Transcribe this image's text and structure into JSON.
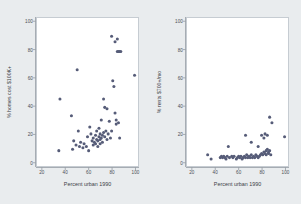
{
  "figure": {
    "background_color": "#e9ecee",
    "panel_background_color": "#ffffff",
    "marker_color": "#565c78",
    "frame_color": "#c6ccd2"
  },
  "chart_data": [
    {
      "type": "scatter",
      "title": "",
      "xlabel": "Percent urban 1990",
      "ylabel": "% homes cost $100K+",
      "xlim": [
        15,
        103
      ],
      "ylim": [
        -3,
        103
      ],
      "xticks": [
        20,
        40,
        60,
        80,
        100
      ],
      "yticks": [
        0,
        20,
        40,
        60,
        80,
        100
      ],
      "grid": false,
      "legend": "none",
      "points": [
        {
          "x": 35,
          "y": 45
        },
        {
          "x": 34,
          "y": 8
        },
        {
          "x": 45,
          "y": 33
        },
        {
          "x": 46,
          "y": 9
        },
        {
          "x": 47,
          "y": 15
        },
        {
          "x": 49,
          "y": 12
        },
        {
          "x": 50,
          "y": 66
        },
        {
          "x": 51,
          "y": 22
        },
        {
          "x": 52,
          "y": 11
        },
        {
          "x": 53,
          "y": 14
        },
        {
          "x": 55,
          "y": 10
        },
        {
          "x": 56,
          "y": 13
        },
        {
          "x": 58,
          "y": 11
        },
        {
          "x": 59,
          "y": 18
        },
        {
          "x": 60,
          "y": 8
        },
        {
          "x": 61,
          "y": 25
        },
        {
          "x": 62,
          "y": 20
        },
        {
          "x": 63,
          "y": 15
        },
        {
          "x": 64,
          "y": 12
        },
        {
          "x": 64,
          "y": 17
        },
        {
          "x": 65,
          "y": 14
        },
        {
          "x": 66,
          "y": 19
        },
        {
          "x": 66,
          "y": 13
        },
        {
          "x": 67,
          "y": 16
        },
        {
          "x": 67,
          "y": 22
        },
        {
          "x": 68,
          "y": 15
        },
        {
          "x": 68,
          "y": 11
        },
        {
          "x": 69,
          "y": 18
        },
        {
          "x": 69,
          "y": 24
        },
        {
          "x": 70,
          "y": 16
        },
        {
          "x": 70,
          "y": 13
        },
        {
          "x": 70,
          "y": 20
        },
        {
          "x": 71,
          "y": 17
        },
        {
          "x": 71,
          "y": 30
        },
        {
          "x": 72,
          "y": 19
        },
        {
          "x": 72,
          "y": 14
        },
        {
          "x": 73,
          "y": 21
        },
        {
          "x": 73,
          "y": 45
        },
        {
          "x": 74,
          "y": 39
        },
        {
          "x": 74,
          "y": 18
        },
        {
          "x": 75,
          "y": 22
        },
        {
          "x": 76,
          "y": 38
        },
        {
          "x": 76,
          "y": 16
        },
        {
          "x": 77,
          "y": 20
        },
        {
          "x": 78,
          "y": 29
        },
        {
          "x": 79,
          "y": 17
        },
        {
          "x": 80,
          "y": 90
        },
        {
          "x": 80,
          "y": 22
        },
        {
          "x": 81,
          "y": 58
        },
        {
          "x": 82,
          "y": 54
        },
        {
          "x": 83,
          "y": 86
        },
        {
          "x": 83,
          "y": 35
        },
        {
          "x": 84,
          "y": 27
        },
        {
          "x": 84,
          "y": 30
        },
        {
          "x": 85,
          "y": 88
        },
        {
          "x": 85,
          "y": 79
        },
        {
          "x": 86,
          "y": 79
        },
        {
          "x": 86,
          "y": 28
        },
        {
          "x": 87,
          "y": 79
        },
        {
          "x": 87,
          "y": 17
        },
        {
          "x": 88,
          "y": 79
        },
        {
          "x": 100,
          "y": 62
        }
      ]
    },
    {
      "type": "scatter",
      "title": "",
      "xlabel": "Percent urban 1990",
      "ylabel": "% rents $700+/mo",
      "xlim": [
        15,
        103
      ],
      "ylim": [
        -3,
        103
      ],
      "xticks": [
        20,
        40,
        60,
        80,
        100
      ],
      "yticks": [
        0,
        20,
        40,
        60,
        80,
        100
      ],
      "grid": false,
      "legend": "none",
      "points": [
        {
          "x": 33,
          "y": 5
        },
        {
          "x": 36,
          "y": 2
        },
        {
          "x": 44,
          "y": 3
        },
        {
          "x": 45,
          "y": 4
        },
        {
          "x": 46,
          "y": 3
        },
        {
          "x": 47,
          "y": 4
        },
        {
          "x": 48,
          "y": 3
        },
        {
          "x": 49,
          "y": 2
        },
        {
          "x": 50,
          "y": 4
        },
        {
          "x": 51,
          "y": 11
        },
        {
          "x": 52,
          "y": 3
        },
        {
          "x": 54,
          "y": 4
        },
        {
          "x": 55,
          "y": 3
        },
        {
          "x": 56,
          "y": 4
        },
        {
          "x": 58,
          "y": 2
        },
        {
          "x": 59,
          "y": 3
        },
        {
          "x": 60,
          "y": 4
        },
        {
          "x": 61,
          "y": 3
        },
        {
          "x": 62,
          "y": 4
        },
        {
          "x": 63,
          "y": 2
        },
        {
          "x": 64,
          "y": 3
        },
        {
          "x": 65,
          "y": 4
        },
        {
          "x": 66,
          "y": 19
        },
        {
          "x": 66,
          "y": 3
        },
        {
          "x": 67,
          "y": 5
        },
        {
          "x": 68,
          "y": 3
        },
        {
          "x": 69,
          "y": 4
        },
        {
          "x": 70,
          "y": 3
        },
        {
          "x": 71,
          "y": 14
        },
        {
          "x": 71,
          "y": 5
        },
        {
          "x": 72,
          "y": 3
        },
        {
          "x": 73,
          "y": 4
        },
        {
          "x": 74,
          "y": 3
        },
        {
          "x": 75,
          "y": 5
        },
        {
          "x": 76,
          "y": 4
        },
        {
          "x": 77,
          "y": 11
        },
        {
          "x": 77,
          "y": 3
        },
        {
          "x": 78,
          "y": 4
        },
        {
          "x": 79,
          "y": 5
        },
        {
          "x": 80,
          "y": 19
        },
        {
          "x": 80,
          "y": 6
        },
        {
          "x": 81,
          "y": 5
        },
        {
          "x": 82,
          "y": 17
        },
        {
          "x": 82,
          "y": 7
        },
        {
          "x": 83,
          "y": 20
        },
        {
          "x": 83,
          "y": 6
        },
        {
          "x": 84,
          "y": 8
        },
        {
          "x": 84,
          "y": 5
        },
        {
          "x": 85,
          "y": 19
        },
        {
          "x": 85,
          "y": 9
        },
        {
          "x": 86,
          "y": 7
        },
        {
          "x": 86,
          "y": 6
        },
        {
          "x": 87,
          "y": 32
        },
        {
          "x": 87,
          "y": 8
        },
        {
          "x": 88,
          "y": 5
        },
        {
          "x": 89,
          "y": 28
        },
        {
          "x": 100,
          "y": 18
        }
      ]
    }
  ],
  "panels": [
    {
      "name": "homes-cost-panel",
      "xlabel": "Percent urban 1990",
      "ylabel": "% homes cost $100K+",
      "xticks": [
        "20",
        "40",
        "60",
        "80",
        "100"
      ],
      "yticks": [
        "0",
        "20",
        "40",
        "60",
        "80",
        "100"
      ]
    },
    {
      "name": "rents-panel",
      "xlabel": "Percent urban 1990",
      "ylabel": "% rents $700+/mo",
      "xticks": [
        "20",
        "40",
        "60",
        "80",
        "100"
      ],
      "yticks": [
        "0",
        "20",
        "40",
        "60",
        "80",
        "100"
      ]
    }
  ]
}
